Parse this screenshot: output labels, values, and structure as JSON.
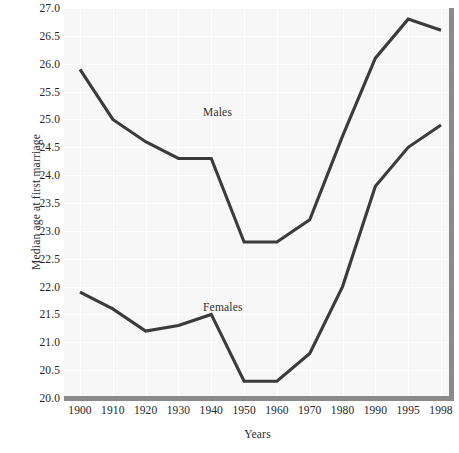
{
  "chart_data": {
    "type": "line",
    "title": "",
    "xlabel": "Years",
    "ylabel": "Median age at first marriage",
    "x": [
      "1900",
      "1910",
      "1920",
      "1930",
      "1940",
      "1950",
      "1960",
      "1970",
      "1980",
      "1990",
      "1995",
      "1998"
    ],
    "categories": [
      "1900",
      "1910",
      "1920",
      "1930",
      "1940",
      "1950",
      "1960",
      "1970",
      "1980",
      "1990",
      "1995",
      "1998"
    ],
    "xticklabels": [
      "1900",
      "1910",
      "1920",
      "1930",
      "1940",
      "1950",
      "1960",
      "1970",
      "1980",
      "1990",
      "1995",
      "1998"
    ],
    "yticklabels": [
      "20.0",
      "20.5",
      "21.0",
      "21.5",
      "22.0",
      "22.5",
      "23.0",
      "23.5",
      "24.0",
      "24.5",
      "25.0",
      "25.5",
      "26.0",
      "26.5",
      "27.0"
    ],
    "ylim": [
      20.0,
      27.0
    ],
    "ytick_step": 0.5,
    "grid": true,
    "legend_position": "inline-annotation",
    "series": [
      {
        "name": "Males",
        "label": "Males",
        "color": "#3b3b3b",
        "values": [
          25.9,
          25.0,
          24.6,
          24.3,
          24.3,
          22.8,
          22.8,
          23.2,
          24.7,
          26.1,
          26.8,
          26.6
        ]
      },
      {
        "name": "Females",
        "label": "Females",
        "color": "#3b3b3b",
        "values": [
          21.9,
          21.6,
          21.2,
          21.3,
          21.5,
          20.3,
          20.3,
          20.8,
          22.0,
          23.8,
          24.5,
          24.9
        ]
      }
    ],
    "annotations": [
      {
        "text": "Males",
        "x": "1920",
        "y": 25.2
      },
      {
        "text": "Females",
        "x": "1920",
        "y": 21.9
      }
    ],
    "colors": {
      "line": "#3b3b3b",
      "panel_background": "#f7f7f7",
      "grid": "#ffffff",
      "axis_rule": "#8a8a8a",
      "text": "#24242a",
      "page_background": "#ffffff"
    }
  }
}
